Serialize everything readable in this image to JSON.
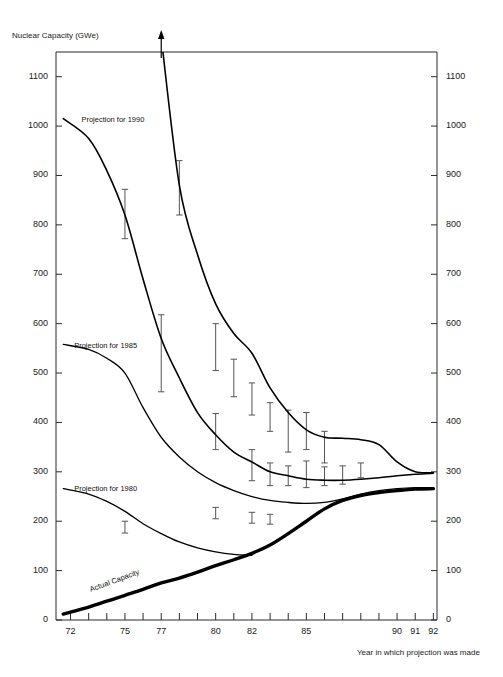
{
  "chart_data": {
    "type": "line",
    "title": "",
    "xlabel": "Year in which projection was made",
    "ylabel": "Nuclear Capacity (GWe)",
    "xlim": [
      71.2,
      92.2
    ],
    "ylim": [
      0,
      1150
    ],
    "grid": false,
    "legend_position": "inline-annotations",
    "y_ticks": [
      0,
      100,
      200,
      300,
      400,
      500,
      600,
      700,
      800,
      900,
      1000,
      1100
    ],
    "y_tick_labels": [
      "0",
      "100",
      "200",
      "300",
      "400",
      "500",
      "600",
      "700",
      "800",
      "900",
      "1000",
      "1100"
    ],
    "y_axis_duplicated_right": true,
    "x_ticks": [
      72,
      73,
      74,
      75,
      76,
      77,
      78,
      79,
      80,
      81,
      82,
      83,
      84,
      85,
      86,
      87,
      88,
      89,
      90,
      91,
      92
    ],
    "x_tick_labels_shown": [
      "72",
      "75",
      "77",
      "80",
      "82",
      "85",
      "90",
      "91",
      "92"
    ],
    "x_tick_label_values": [
      72,
      75,
      77,
      80,
      82,
      85,
      90,
      91,
      92
    ],
    "series": [
      {
        "name": "Projection for 2000",
        "label": "Projection for 2000",
        "label_x": 182,
        "label_y": 168,
        "line_width": 1.6,
        "off_chart_arrow": {
          "x": 77,
          "to_value": 1180,
          "note": "curve exceeds plot top"
        },
        "x": [
          77,
          78,
          79,
          80,
          81,
          82,
          83,
          84,
          85,
          86,
          87,
          88,
          89,
          90,
          91,
          92
        ],
        "values": [
          1180,
          880,
          740,
          640,
          580,
          540,
          470,
          420,
          385,
          370,
          368,
          365,
          355,
          320,
          300,
          298
        ]
      },
      {
        "name": "Projection for 1990",
        "label": "Projection for 1990",
        "label_x": 72.6,
        "label_y": 1012,
        "line_width": 1.6,
        "x": [
          71.6,
          73,
          74,
          75,
          76,
          77,
          78,
          79,
          80,
          81,
          82,
          83,
          84,
          85,
          86,
          87,
          88,
          89,
          90,
          91,
          92
        ],
        "values": [
          1015,
          975,
          910,
          820,
          690,
          570,
          490,
          420,
          375,
          340,
          320,
          300,
          292,
          285,
          283,
          283,
          285,
          288,
          292,
          295,
          297
        ]
      },
      {
        "name": "Projection for 1985",
        "label": "Projection for 1985",
        "label_x": 72.2,
        "label_y": 555,
        "line_width": 1.3,
        "x": [
          71.6,
          73,
          74,
          75,
          76,
          77,
          78,
          79,
          80,
          81,
          82,
          83,
          84,
          85,
          86,
          87,
          88,
          89,
          90,
          91,
          92
        ],
        "values": [
          558,
          548,
          530,
          500,
          430,
          370,
          330,
          300,
          278,
          262,
          250,
          242,
          238,
          236,
          238,
          245,
          255,
          262,
          266,
          268,
          268
        ]
      },
      {
        "name": "Projection for 1980",
        "label": "Projection for 1980",
        "label_x": 72.2,
        "label_y": 265,
        "line_width": 1.3,
        "x": [
          71.6,
          73,
          74,
          75,
          76,
          77,
          78,
          79,
          80,
          81,
          82
        ],
        "values": [
          266,
          255,
          240,
          220,
          195,
          175,
          158,
          146,
          138,
          133,
          131
        ]
      },
      {
        "name": "Actual Capacity",
        "label": "Actual Capacity",
        "label_x": 73.1,
        "label_y": 60,
        "line_width": 3.4,
        "x": [
          71.6,
          72,
          73,
          74,
          75,
          76,
          77,
          78,
          79,
          80,
          81,
          82,
          83,
          84,
          85,
          86,
          87,
          88,
          89,
          90,
          91,
          92
        ],
        "values": [
          12,
          16,
          26,
          38,
          50,
          62,
          75,
          85,
          97,
          110,
          122,
          135,
          152,
          175,
          200,
          225,
          242,
          252,
          258,
          262,
          265,
          266
        ]
      }
    ],
    "error_bars": [
      {
        "series": "Projection for 1990",
        "x": 75,
        "low": 772,
        "high": 872
      },
      {
        "series": "Projection for 1990",
        "x": 77,
        "low": 462,
        "high": 618
      },
      {
        "series": "Projection for 1990",
        "x": 80,
        "low": 345,
        "high": 418
      },
      {
        "series": "Projection for 1990",
        "x": 82,
        "low": 282,
        "high": 345
      },
      {
        "series": "Projection for 1990",
        "x": 83,
        "low": 272,
        "high": 318
      },
      {
        "series": "Projection for 1990",
        "x": 84,
        "low": 272,
        "high": 312
      },
      {
        "series": "Projection for 1990",
        "x": 85,
        "low": 268,
        "high": 322
      },
      {
        "series": "Projection for 1990",
        "x": 86,
        "low": 272,
        "high": 310
      },
      {
        "series": "Projection for 1990",
        "x": 87,
        "low": 275,
        "high": 312
      },
      {
        "series": "Projection for 1985",
        "x": 75,
        "low": 176,
        "high": 200
      },
      {
        "series": "Projection for 1985",
        "x": 80,
        "low": 205,
        "high": 228
      },
      {
        "series": "Projection for 1985",
        "x": 82,
        "low": 196,
        "high": 218
      },
      {
        "series": "Projection for 1985",
        "x": 83,
        "low": 194,
        "high": 214
      },
      {
        "series": "Projection for 2000",
        "x": 78,
        "low": 820,
        "high": 930
      },
      {
        "series": "Projection for 2000",
        "x": 80,
        "low": 505,
        "high": 600
      },
      {
        "series": "Projection for 2000",
        "x": 81,
        "low": 452,
        "high": 528
      },
      {
        "series": "Projection for 2000",
        "x": 82,
        "low": 415,
        "high": 480
      },
      {
        "series": "Projection for 2000",
        "x": 83,
        "low": 382,
        "high": 440
      },
      {
        "series": "Projection for 2000",
        "x": 84,
        "low": 340,
        "high": 425
      },
      {
        "series": "Projection for 2000",
        "x": 85,
        "low": 345,
        "high": 420
      },
      {
        "series": "Projection for 2000",
        "x": 86,
        "low": 318,
        "high": 382
      },
      {
        "series": "Projection for 2000",
        "x": 88,
        "low": 288,
        "high": 318
      }
    ]
  },
  "axes": {
    "y_title": "Nuclear Capacity (GWe)",
    "x_title": "Year in which projection was made",
    "y_labels": [
      "1100",
      "1000",
      "900",
      "800",
      "700",
      "600",
      "500",
      "400",
      "300",
      "200",
      "100",
      "0"
    ],
    "x_labels": [
      "72",
      "75",
      "77",
      "80",
      "82",
      "85",
      "90",
      "91",
      "92"
    ]
  },
  "watermark": {
    "text": ""
  },
  "colors": {
    "line": "#000000",
    "axis": "#2b2b2b",
    "error_bar": "#555555",
    "background": "#ffffff",
    "text": "#1a1a1a"
  }
}
